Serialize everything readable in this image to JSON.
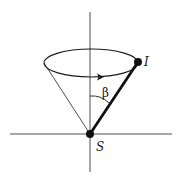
{
  "figure": {
    "labels": {
      "top_point": "I",
      "apex_point": "S",
      "angle": "β"
    },
    "elements": {
      "vertical_axis": "axis",
      "horizontal_axis": "axis",
      "cone": "precession cone",
      "rotation_direction": "arrow on rim indicating precession direction",
      "vector": "thick line from S to I"
    },
    "colors": {
      "line": "#1a1a1a",
      "background": "#ffffff"
    }
  }
}
